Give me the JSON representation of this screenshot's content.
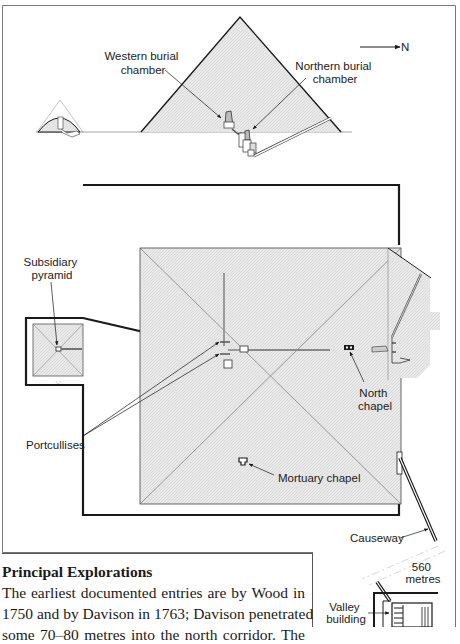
{
  "figure": {
    "compass": {
      "label": "N",
      "icon": "north-arrow-icon"
    },
    "section_view": {
      "labels": {
        "western_chamber": [
          "Western burial",
          "chamber"
        ],
        "northern_chamber": [
          "Northern burial",
          "chamber"
        ]
      }
    },
    "plan_view": {
      "labels": {
        "subsidiary_pyramid": [
          "Subsidiary",
          "pyramid"
        ],
        "portcullises": "Portcullises",
        "north_chapel": [
          "North",
          "chapel"
        ],
        "mortuary_chapel": "Mortuary chapel",
        "causeway": "Causeway",
        "causeway_length": [
          "560",
          "metres"
        ],
        "valley_building": [
          "Valley",
          "building"
        ]
      }
    },
    "colors": {
      "line": "#1a1a1a",
      "fill": "#e6e6e6",
      "frame": "#666666"
    }
  },
  "text_section": {
    "heading": "Principal Explorations",
    "lines": [
      "The earliest documented entries are by Wood in",
      "1750 and by Davison in 1763; Davison penetrated",
      "some 70–80 metres into the north corridor. The"
    ]
  }
}
